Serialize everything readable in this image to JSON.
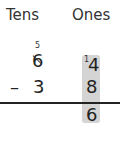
{
  "headers": {
    "tens": "Tens",
    "ones": "Ones"
  },
  "regroup": {
    "new_tens": "5",
    "carried_one": "1"
  },
  "minuend": {
    "tens": "6",
    "ones": "4"
  },
  "subtrahend": {
    "operator": "–",
    "tens": "3",
    "ones": "8"
  },
  "answer": {
    "ones": "6"
  },
  "colors": {
    "highlight": "#d4d4d4",
    "text": "#222222"
  }
}
